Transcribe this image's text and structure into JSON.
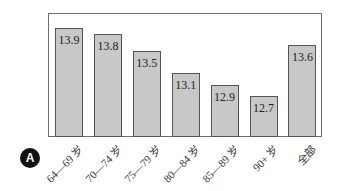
{
  "chart_data": {
    "type": "bar",
    "title": "",
    "xlabel": "",
    "ylabel": "",
    "categories": [
      "64—69 岁",
      "70—74 岁",
      "75—79 岁",
      "80—84 岁",
      "85—89 岁",
      "90+ 岁",
      "全部"
    ],
    "values": [
      13.9,
      13.8,
      13.5,
      13.1,
      12.9,
      12.7,
      13.6
    ],
    "data_labels": [
      "13.9",
      "13.8",
      "13.5",
      "13.1",
      "12.9",
      "12.7",
      "13.6"
    ],
    "grid": false,
    "legend": null,
    "bar_color": "#c8c8c8",
    "panel_label": "A"
  }
}
